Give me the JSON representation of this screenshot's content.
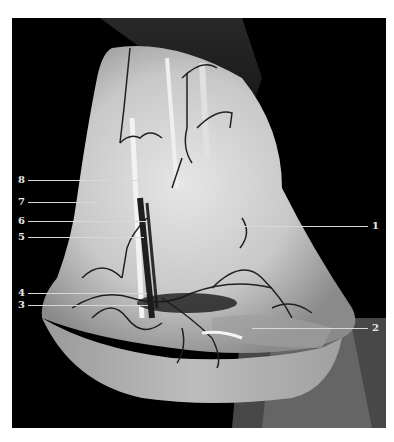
{
  "figure": {
    "background": "#000000",
    "page_background": "#ffffff",
    "labels_left": [
      {
        "id": "8",
        "text": "8",
        "y": 180,
        "line_end_x": 141
      },
      {
        "id": "7",
        "text": "7",
        "y": 202,
        "line_end_x": 97
      },
      {
        "id": "6",
        "text": "6",
        "y": 221,
        "line_end_x": 147
      },
      {
        "id": "5",
        "text": "5",
        "y": 237,
        "line_end_x": 144
      },
      {
        "id": "4",
        "text": "4",
        "y": 293,
        "line_end_x": 147
      },
      {
        "id": "3",
        "text": "3",
        "y": 305,
        "line_end_x": 148
      }
    ],
    "labels_right": [
      {
        "id": "1",
        "text": "1",
        "y": 226,
        "line_start_x": 215
      },
      {
        "id": "2",
        "text": "2",
        "y": 328,
        "line_start_x": 252
      }
    ]
  }
}
